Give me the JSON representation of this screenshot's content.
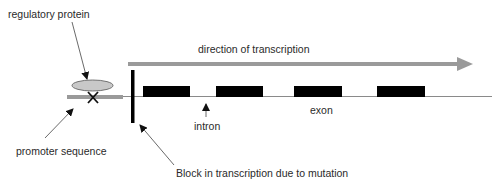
{
  "diagram": {
    "labels": {
      "regulatory_protein": "regulatory protein",
      "direction": "direction of transcription",
      "intron": "intron",
      "exon": "exon",
      "promoter": "promoter sequence",
      "block": "Block in transcription due to mutation"
    },
    "exons": [
      {
        "x": 143,
        "w": 47
      },
      {
        "x": 216,
        "w": 47
      },
      {
        "x": 294,
        "w": 48
      },
      {
        "x": 377,
        "w": 48
      }
    ],
    "colors": {
      "gray": "#9a9a9a",
      "protein_fill": "#c8c8c8",
      "black": "#000000",
      "line": "#888888"
    }
  }
}
